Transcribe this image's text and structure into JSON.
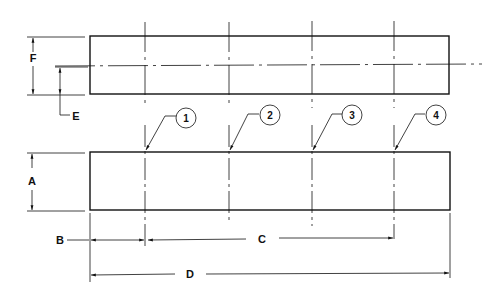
{
  "diagram": {
    "type": "engineering-drawing",
    "views": [
      "top-view",
      "front-view"
    ],
    "dimension_labels": {
      "A": "A",
      "B": "B",
      "C": "C",
      "D": "D",
      "E": "E",
      "F": "F"
    },
    "callouts": [
      "1",
      "2",
      "3",
      "4"
    ],
    "colors": {
      "line": "#111111",
      "background": "#ffffff"
    }
  }
}
